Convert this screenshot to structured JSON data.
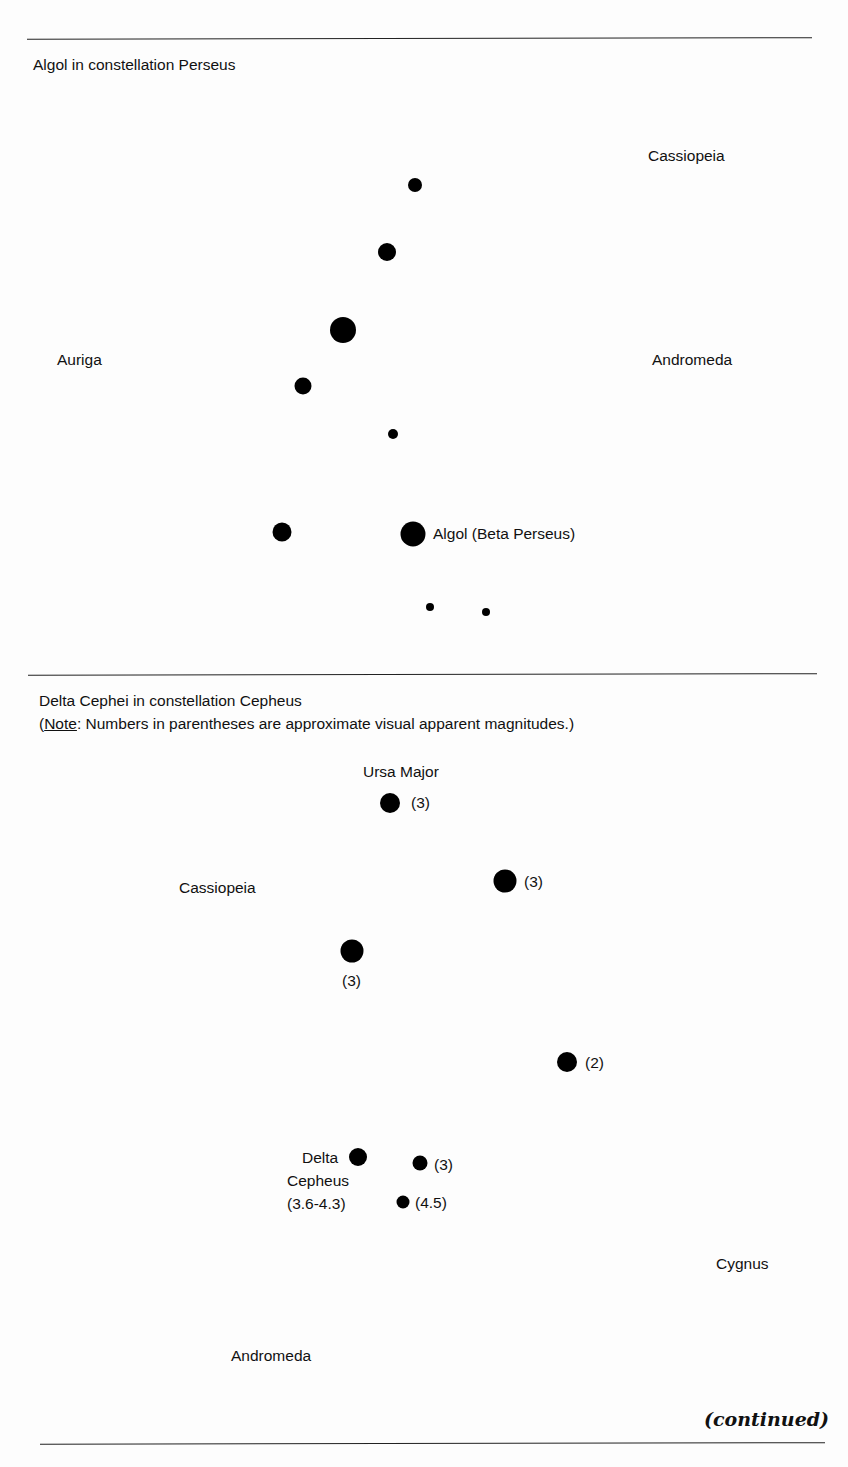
{
  "section1": {
    "title": "Algol in constellation Perseus",
    "labels": {
      "cassiopeia": "Cassiopeia",
      "auriga": "Auriga",
      "andromeda": "Andromeda",
      "algol": "Algol (Beta Perseus)"
    }
  },
  "section2": {
    "title": "Delta Cephei in constellation Cepheus",
    "note_open": "(",
    "note_word": "Note",
    "note_rest": ":  Numbers in parentheses are approximate visual apparent magnitudes.)",
    "labels": {
      "ursa_major": "Ursa Major",
      "cassiopeia": "Cassiopeia",
      "cygnus": "Cygnus",
      "andromeda": "Andromeda",
      "delta1": "Delta",
      "delta2": "Cepheus",
      "delta3": "(3.6-4.3)"
    },
    "magnitudes": {
      "m1": "(3)",
      "m2": "(3)",
      "m3": "(3)",
      "m4": "(2)",
      "m5": "(3)",
      "m6": "(4.5)"
    }
  },
  "footer": {
    "continued": "(continued)"
  }
}
